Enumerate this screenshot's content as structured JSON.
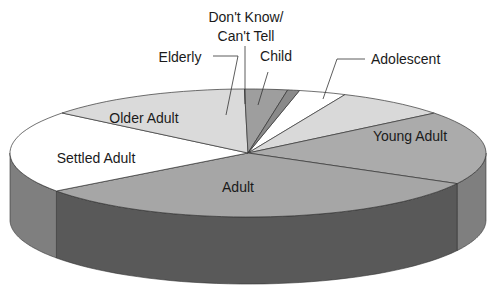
{
  "chart_data": {
    "type": "pie",
    "style": "3d",
    "title": "",
    "unit": "percent",
    "slices": [
      {
        "label": "Child",
        "value": 3.2,
        "color": "#ffffff"
      },
      {
        "label": "Adolescent",
        "value": 7.6,
        "color": "#d9d9d9"
      },
      {
        "label": "Young Adult",
        "value": 18.6,
        "color": "#ababab"
      },
      {
        "label": "Adult",
        "value": 31.9,
        "color": "#a6a6a6"
      },
      {
        "label": "Settled Adult",
        "value": 20.8,
        "color": "#ffffff"
      },
      {
        "label": "Older Adult",
        "value": 14.0,
        "color": "#dadada"
      },
      {
        "label": "Elderly",
        "value": 2.9,
        "color": "#9e9e9e"
      },
      {
        "label": "Don't Know/ Can't Tell",
        "value": 0.8,
        "color": "#8a8a8a"
      }
    ],
    "labels_display": [
      {
        "slice": "Child",
        "lines": [
          "Child"
        ],
        "leader": true
      },
      {
        "slice": "Adolescent",
        "lines": [
          "Adolescent"
        ],
        "leader": true
      },
      {
        "slice": "Young Adult",
        "lines": [
          "Young Adult"
        ],
        "leader": false
      },
      {
        "slice": "Adult",
        "lines": [
          "Adult"
        ],
        "leader": false
      },
      {
        "slice": "Settled Adult",
        "lines": [
          "Settled Adult"
        ],
        "leader": false
      },
      {
        "slice": "Older Adult",
        "lines": [
          "Older Adult"
        ],
        "leader": false
      },
      {
        "slice": "Elderly",
        "lines": [
          "Elderly"
        ],
        "leader": true
      },
      {
        "slice": "Don't Know/ Can't Tell",
        "lines": [
          "Don't Know/",
          "Can't Tell"
        ],
        "leader": true
      }
    ],
    "start_angle_deg": 77.5,
    "direction": "clockwise-from-child",
    "side_colors": {
      "light": "#7f7f7f",
      "dark": "#595959"
    }
  }
}
